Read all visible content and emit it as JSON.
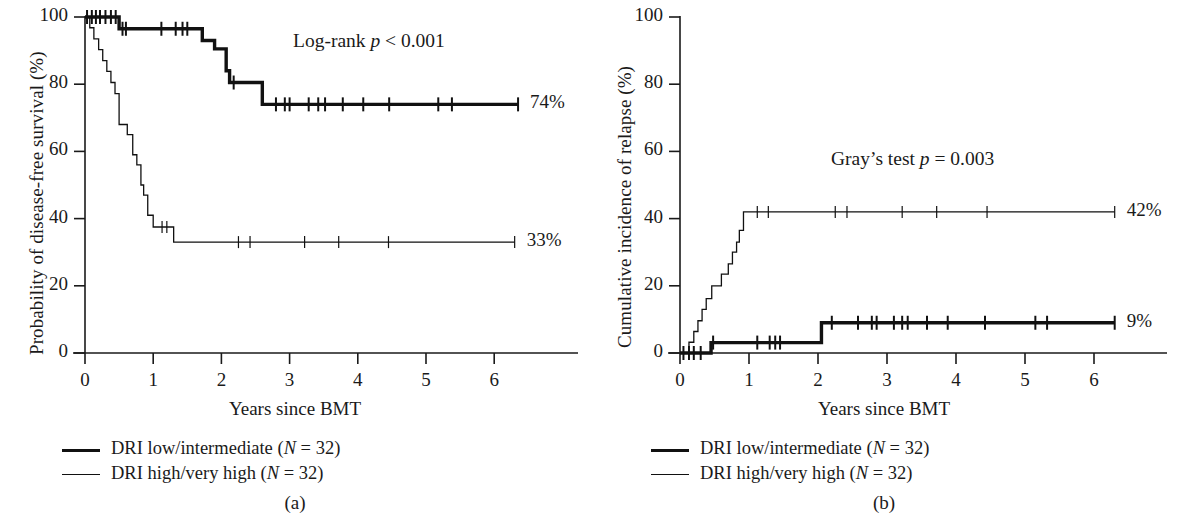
{
  "figure": {
    "panels": [
      {
        "id": "a",
        "subcaption": "(a)",
        "ylabel": "Probability of disease-free survival (%)",
        "xlabel": "Years since BMT",
        "annotation_prefix": "Log-rank ",
        "annotation_italic": "p",
        "annotation_suffix": " < 0.001",
        "yticks": [
          "0",
          "20",
          "40",
          "60",
          "80",
          "100"
        ],
        "xticks": [
          "0",
          "1",
          "2",
          "3",
          "4",
          "5",
          "6"
        ],
        "endlabels": [
          "74%",
          "33%"
        ],
        "legend": [
          {
            "style": "thick",
            "text_pre": "DRI low/intermediate (",
            "text_italic": "N",
            "text_post": " = 32)"
          },
          {
            "style": "thin",
            "text_pre": "DRI high/very high (",
            "text_italic": "N",
            "text_post": " = 32)"
          }
        ]
      },
      {
        "id": "b",
        "subcaption": "(b)",
        "ylabel": "Cumulative incidence of relapse (%)",
        "xlabel": "Years since BMT",
        "annotation_prefix": "Gray’s test ",
        "annotation_italic": "p",
        "annotation_suffix": " = 0.003",
        "yticks": [
          "0",
          "20",
          "40",
          "60",
          "80",
          "100"
        ],
        "xticks": [
          "0",
          "1",
          "2",
          "3",
          "4",
          "5",
          "6"
        ],
        "endlabels": [
          "42%",
          "9%"
        ],
        "legend": [
          {
            "style": "thick",
            "text_pre": "DRI low/intermediate (",
            "text_italic": "N",
            "text_post": " = 32)"
          },
          {
            "style": "thin",
            "text_pre": "DRI high/very high (",
            "text_italic": "N",
            "text_post": " = 32)"
          }
        ]
      }
    ]
  },
  "chart_data": [
    {
      "type": "line",
      "panel": "a",
      "title": "Probability of disease-free survival by DRI group",
      "xlabel": "Years since BMT",
      "ylabel": "Probability of disease-free survival (%)",
      "xlim": [
        0,
        6.9
      ],
      "ylim": [
        0,
        100
      ],
      "xticks": [
        0,
        1,
        2,
        3,
        4,
        5,
        6
      ],
      "yticks": [
        0,
        20,
        40,
        60,
        80,
        100
      ],
      "grid": false,
      "annotation": "Log-rank p < 0.001",
      "legend_position": "below-left",
      "series": [
        {
          "name": "DRI low/intermediate (N = 32)",
          "style": "thick",
          "final_label": "74%",
          "steps": [
            [
              0.0,
              100.0
            ],
            [
              0.5,
              100.0
            ],
            [
              0.5,
              96.5
            ],
            [
              1.72,
              96.5
            ],
            [
              1.72,
              93.0
            ],
            [
              1.9,
              93.0
            ],
            [
              1.9,
              90.5
            ],
            [
              2.07,
              90.5
            ],
            [
              2.07,
              84.0
            ],
            [
              2.12,
              84.0
            ],
            [
              2.12,
              80.5
            ],
            [
              2.6,
              80.5
            ],
            [
              2.6,
              74.0
            ],
            [
              6.35,
              74.0
            ]
          ],
          "censor_marks": [
            0.03,
            0.1,
            0.16,
            0.22,
            0.3,
            0.38,
            0.45,
            0.55,
            0.6,
            1.12,
            1.33,
            1.43,
            1.5,
            2.18,
            2.8,
            2.93,
            3.0,
            3.28,
            3.42,
            3.52,
            3.78,
            4.08,
            4.46,
            5.18,
            5.38,
            6.35
          ]
        },
        {
          "name": "DRI high/very high (N = 32)",
          "style": "thin",
          "final_label": "33%",
          "steps": [
            [
              0.0,
              100.0
            ],
            [
              0.07,
              100.0
            ],
            [
              0.07,
              96.8
            ],
            [
              0.13,
              96.8
            ],
            [
              0.13,
              93.5
            ],
            [
              0.2,
              93.5
            ],
            [
              0.2,
              90.3
            ],
            [
              0.26,
              90.3
            ],
            [
              0.26,
              87.0
            ],
            [
              0.32,
              87.0
            ],
            [
              0.32,
              83.8
            ],
            [
              0.38,
              83.8
            ],
            [
              0.38,
              80.5
            ],
            [
              0.44,
              80.5
            ],
            [
              0.44,
              77.2
            ],
            [
              0.5,
              77.2
            ],
            [
              0.5,
              68.0
            ],
            [
              0.62,
              68.0
            ],
            [
              0.62,
              65.0
            ],
            [
              0.7,
              65.0
            ],
            [
              0.7,
              59.0
            ],
            [
              0.76,
              59.0
            ],
            [
              0.76,
              56.0
            ],
            [
              0.82,
              56.0
            ],
            [
              0.82,
              50.0
            ],
            [
              0.86,
              50.0
            ],
            [
              0.86,
              47.0
            ],
            [
              0.92,
              47.0
            ],
            [
              0.92,
              41.0
            ],
            [
              1.0,
              41.0
            ],
            [
              1.0,
              37.5
            ],
            [
              1.3,
              37.5
            ],
            [
              1.3,
              33.0
            ],
            [
              6.3,
              33.0
            ]
          ],
          "censor_marks": [
            1.13,
            1.2,
            2.25,
            2.42,
            3.22,
            3.72,
            4.45,
            6.3
          ]
        }
      ]
    },
    {
      "type": "line",
      "panel": "b",
      "title": "Cumulative incidence of relapse by DRI group",
      "xlabel": "Years since BMT",
      "ylabel": "Cumulative incidence of relapse (%)",
      "xlim": [
        0,
        6.9
      ],
      "ylim": [
        0,
        100
      ],
      "xticks": [
        0,
        1,
        2,
        3,
        4,
        5,
        6
      ],
      "yticks": [
        0,
        20,
        40,
        60,
        80,
        100
      ],
      "grid": false,
      "annotation": "Gray’s test p = 0.003",
      "legend_position": "below-left",
      "series": [
        {
          "name": "DRI low/intermediate (N = 32)",
          "style": "thick",
          "final_label": "9%",
          "steps": [
            [
              0.0,
              0.0
            ],
            [
              0.45,
              0.0
            ],
            [
              0.45,
              3.1
            ],
            [
              2.05,
              3.1
            ],
            [
              2.05,
              9.0
            ],
            [
              6.3,
              9.0
            ]
          ],
          "censor_marks": [
            0.05,
            0.13,
            0.2,
            0.3,
            0.48,
            1.12,
            1.3,
            1.38,
            1.45,
            2.2,
            2.58,
            2.78,
            2.85,
            3.1,
            3.22,
            3.3,
            3.58,
            3.88,
            4.42,
            5.15,
            5.32,
            6.3
          ]
        },
        {
          "name": "DRI high/very high (N = 32)",
          "style": "thin",
          "final_label": "42%",
          "steps": [
            [
              0.0,
              0.0
            ],
            [
              0.13,
              0.0
            ],
            [
              0.13,
              3.2
            ],
            [
              0.2,
              3.2
            ],
            [
              0.2,
              6.4
            ],
            [
              0.26,
              6.4
            ],
            [
              0.26,
              9.6
            ],
            [
              0.32,
              9.6
            ],
            [
              0.32,
              13.0
            ],
            [
              0.38,
              13.0
            ],
            [
              0.38,
              16.2
            ],
            [
              0.46,
              16.2
            ],
            [
              0.46,
              20.0
            ],
            [
              0.6,
              20.0
            ],
            [
              0.6,
              23.5
            ],
            [
              0.7,
              23.5
            ],
            [
              0.7,
              26.5
            ],
            [
              0.76,
              26.5
            ],
            [
              0.76,
              30.0
            ],
            [
              0.82,
              30.0
            ],
            [
              0.82,
              33.0
            ],
            [
              0.86,
              33.0
            ],
            [
              0.86,
              36.5
            ],
            [
              0.92,
              36.5
            ],
            [
              0.92,
              42.0
            ],
            [
              6.3,
              42.0
            ]
          ],
          "censor_marks": [
            1.12,
            1.28,
            2.25,
            2.42,
            3.22,
            3.72,
            4.45,
            6.3
          ]
        }
      ]
    }
  ]
}
